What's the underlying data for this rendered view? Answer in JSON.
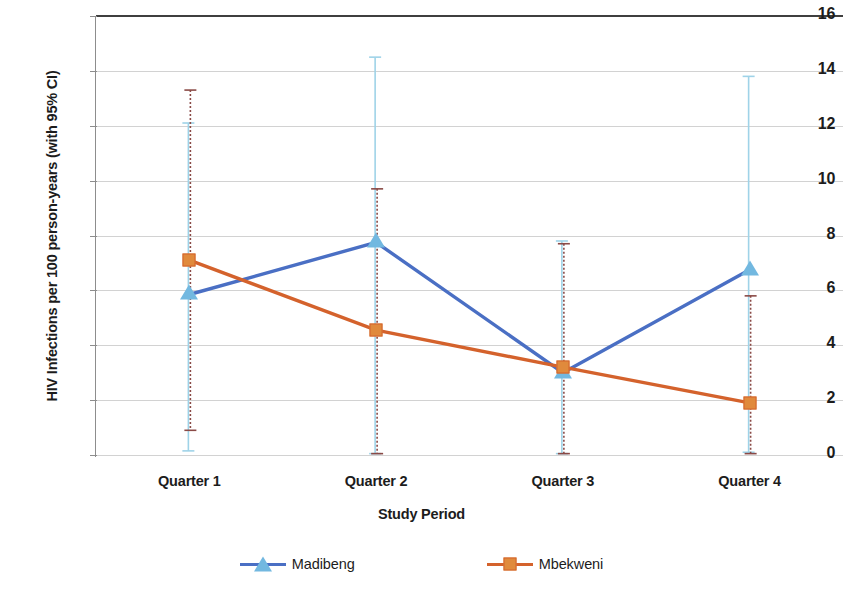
{
  "chart_data": {
    "type": "line",
    "title": "",
    "xlabel": "Study Period",
    "ylabel": "HIV Infections per 100 person-years (with 95% CI)",
    "categories": [
      "Quarter 1",
      "Quarter 2",
      "Quarter 3",
      "Quarter 4"
    ],
    "ylim": [
      0,
      16
    ],
    "yticks": [
      0,
      2,
      4,
      6,
      8,
      10,
      12,
      14,
      16
    ],
    "ytick_labels": [
      "0",
      "2",
      "4",
      "6",
      "8",
      "10",
      "12",
      "14",
      "16"
    ],
    "grid": true,
    "legend_position": "bottom",
    "error_bars": "95% CI",
    "series": [
      {
        "name": "Madibeng",
        "color": "#4a6fc4",
        "marker": "triangle",
        "marker_color": "#72b8e0",
        "error_color": "#9fd3e8",
        "values": [
          5.85,
          7.75,
          3.0,
          6.75
        ],
        "ci_lower": [
          0.15,
          0.05,
          0.05,
          0.1
        ],
        "ci_upper": [
          12.1,
          14.5,
          7.8,
          13.8
        ]
      },
      {
        "name": "Mbekweni",
        "color": "#d4622c",
        "marker": "square",
        "marker_color": "#e08a3c",
        "error_color": "#8a4a46",
        "values": [
          7.1,
          4.55,
          3.2,
          1.9
        ],
        "ci_lower": [
          0.9,
          0.05,
          0.05,
          0.05
        ],
        "ci_upper": [
          13.3,
          9.7,
          7.7,
          5.8
        ]
      }
    ]
  },
  "axes": {
    "y_title": "HIV Infections per 100 person-years (with 95% CI)",
    "x_title": "Study Period",
    "y_labels": [
      "16",
      "14",
      "12",
      "10",
      "8",
      "6",
      "4",
      "2",
      "0"
    ],
    "x_labels": [
      "Quarter 1",
      "Quarter 2",
      "Quarter 3",
      "Quarter 4"
    ]
  },
  "legend": {
    "items": [
      {
        "label": "Madibeng"
      },
      {
        "label": "Mbekweni"
      }
    ]
  },
  "colors": {
    "madibeng_line": "#4a6fc4",
    "madibeng_marker": "#72b8e0",
    "madibeng_error": "#9fd3e8",
    "mbekweni_line": "#d4622c",
    "mbekweni_marker": "#e08a3c",
    "mbekweni_error": "#8a4a46",
    "gridline": "#d2d2d2",
    "axis": "#8d8d8d"
  }
}
